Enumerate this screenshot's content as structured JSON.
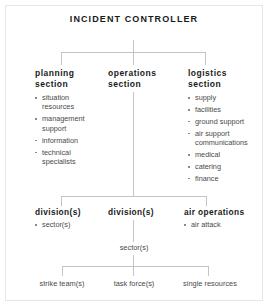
{
  "title": "Incident Controller",
  "sections": [
    {
      "heading": "planning\nsection",
      "heading_line1": "planning",
      "heading_line2": "section",
      "items": [
        "situation resources",
        "management support",
        "information",
        "technical specialists"
      ]
    },
    {
      "heading_line1": "operations",
      "heading_line2": "section",
      "items": []
    },
    {
      "heading_line1": "logistics",
      "heading_line2": "section",
      "items": [
        "supply",
        "facilities",
        "ground support",
        "air support communications",
        "medical",
        "catering",
        "finance"
      ]
    }
  ],
  "mid_row": [
    {
      "heading": "division(s)",
      "items": [
        "sector(s)"
      ]
    },
    {
      "heading": "division(s)",
      "items": []
    },
    {
      "heading": "air operations",
      "items": [
        "air attack"
      ]
    }
  ],
  "sector_label": "sector(s)",
  "bottom_row": [
    "strike team(s)",
    "task force(s)",
    "single resources"
  ],
  "colors": {
    "line": "#c4c4c4",
    "heading_text": "#1a1a1a",
    "body_text": "#4a4a4a",
    "bullet": "#8a8a8a",
    "frame": "#e6e6e6",
    "background": "#ffffff"
  }
}
